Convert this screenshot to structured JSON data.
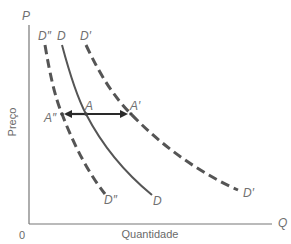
{
  "diagram": {
    "type": "demand-curve-shift",
    "axes": {
      "y_label": "Preço",
      "x_label": "Quantidade",
      "y_symbol": "P",
      "x_symbol": "Q",
      "origin": "0"
    },
    "curves": [
      {
        "id": "D2",
        "label_top": "D″",
        "label_bottom": "D″",
        "style": "dashed"
      },
      {
        "id": "D",
        "label_top": "D",
        "label_bottom": "D",
        "style": "solid"
      },
      {
        "id": "D1",
        "label_top": "D′",
        "label_bottom": "D′",
        "style": "dashed"
      }
    ],
    "points": [
      {
        "id": "A2",
        "label": "A″"
      },
      {
        "id": "A",
        "label": "A"
      },
      {
        "id": "A1",
        "label": "A′"
      }
    ],
    "arrow": {
      "from": "A",
      "to": [
        "A″",
        "A′"
      ],
      "style": "double-headed"
    },
    "colors": {
      "curve": "#555555",
      "axis": "#777777",
      "arrow": "#2a2a2a",
      "label": "#707070"
    }
  }
}
